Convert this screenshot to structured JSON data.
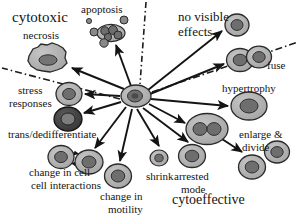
{
  "figure": {
    "background_color": "#ffffff",
    "text_color": "#141414",
    "cell_fill_light": "#b3b3b3",
    "cell_fill_mid": "#9a9a9a",
    "cell_fill_dark": "#4a4a4a",
    "nucleus_fill": "#6e6e6e",
    "outline_color": "#1c1c1c"
  },
  "category_labels": [
    {
      "id": "cytotoxic",
      "text": "cytotoxic",
      "x": 12,
      "y": 10,
      "size": 14.5
    },
    {
      "id": "no-visible",
      "text": "no visible",
      "x": 178,
      "y": 11,
      "size": 12.5
    },
    {
      "id": "no-visible-2",
      "text": "effects",
      "x": 178,
      "y": 26,
      "size": 12.5
    },
    {
      "id": "cytoeffective",
      "text": "cytoeffective",
      "x": 174,
      "y": 195,
      "size": 13.5
    }
  ],
  "outcome_labels": [
    {
      "id": "apoptosis",
      "text": "apoptosis",
      "x": 81,
      "y": 5,
      "size": 10.5
    },
    {
      "id": "necrosis",
      "text": "necrosis",
      "x": 22,
      "y": 31,
      "size": 10.5
    },
    {
      "id": "stress-responses-1",
      "text": "stress",
      "x": 17,
      "y": 86,
      "size": 10.5
    },
    {
      "id": "stress-responses-2",
      "text": "responses",
      "x": 10,
      "y": 99,
      "size": 10.5
    },
    {
      "id": "trans-dedifferentiate",
      "text": "trans/dedifferentiate",
      "x": 8,
      "y": 130,
      "size": 10.5
    },
    {
      "id": "change-cell-cell-1",
      "text": "change in cell-",
      "x": 30,
      "y": 168,
      "size": 10.5
    },
    {
      "id": "change-cell-cell-2",
      "text": "cell interactions",
      "x": 30,
      "y": 181,
      "size": 10.5
    },
    {
      "id": "change-motility-1",
      "text": "change in",
      "x": 100,
      "y": 192,
      "size": 10.5
    },
    {
      "id": "change-motility-2",
      "text": "motility",
      "x": 106,
      "y": 205,
      "size": 10.5
    },
    {
      "id": "shrink",
      "text": "shrink",
      "x": 148,
      "y": 172,
      "size": 10.5
    },
    {
      "id": "arrested-mode-1",
      "text": "arrested",
      "x": 176,
      "y": 172,
      "size": 10.5
    },
    {
      "id": "arrested-mode-2",
      "text": "mode",
      "x": 182,
      "y": 185,
      "size": 10.5
    },
    {
      "id": "fuse",
      "text": "fuse",
      "x": 266,
      "y": 61,
      "size": 10.5
    },
    {
      "id": "hypertrophy",
      "text": "hypertrophy",
      "x": 223,
      "y": 84,
      "size": 10.5
    },
    {
      "id": "enlarge-divide-1",
      "text": "enlarge &",
      "x": 239,
      "y": 130,
      "size": 10.5
    },
    {
      "id": "enlarge-divide-2",
      "text": "divide",
      "x": 242,
      "y": 143,
      "size": 10.5
    }
  ],
  "hub": {
    "id": "central-cell",
    "x": 136,
    "y": 96,
    "rx": 15,
    "ry": 11
  },
  "cells": [
    {
      "id": "necrosis-cell",
      "x": 47,
      "y": 58,
      "rx": 19,
      "ry": 13,
      "style": "jagged"
    },
    {
      "id": "apoptosis-cluster",
      "x": 110,
      "y": 32,
      "rx": 14,
      "ry": 9,
      "style": "fragmented"
    },
    {
      "id": "no-visible-effects-cell",
      "x": 237,
      "y": 25,
      "rx": 12,
      "ry": 11,
      "style": "round"
    },
    {
      "id": "fuse-cell-left",
      "x": 240,
      "y": 59,
      "rx": 13,
      "ry": 11,
      "style": "round"
    },
    {
      "id": "fuse-cell-right",
      "x": 259,
      "y": 57,
      "rx": 12,
      "ry": 10,
      "style": "round"
    },
    {
      "id": "hypertrophy-cell",
      "x": 248,
      "y": 106,
      "rx": 17,
      "ry": 14,
      "style": "round"
    },
    {
      "id": "enlarge-divide-cell",
      "x": 207,
      "y": 129,
      "rx": 20,
      "ry": 15,
      "style": "binucleate"
    },
    {
      "id": "daughter-cell-upper",
      "x": 277,
      "y": 152,
      "rx": 12,
      "ry": 11,
      "style": "round"
    },
    {
      "id": "daughter-cell-lower",
      "x": 252,
      "y": 167,
      "rx": 13,
      "ry": 12,
      "style": "round"
    },
    {
      "id": "arrested-mode-cell",
      "x": 192,
      "y": 156,
      "rx": 13,
      "ry": 11,
      "style": "round"
    },
    {
      "id": "shrink-cell",
      "x": 159,
      "y": 158,
      "rx": 9,
      "ry": 8,
      "style": "round"
    },
    {
      "id": "motility-cell",
      "x": 118,
      "y": 176,
      "rx": 13,
      "ry": 12,
      "style": "round"
    },
    {
      "id": "interaction-cell-left",
      "x": 61,
      "y": 157,
      "rx": 13,
      "ry": 11,
      "style": "round"
    },
    {
      "id": "interaction-cell-right",
      "x": 88,
      "y": 162,
      "rx": 14,
      "ry": 12,
      "style": "round"
    },
    {
      "id": "trans-dediff-cell",
      "x": 68,
      "y": 119,
      "rx": 14,
      "ry": 12,
      "style": "dark"
    },
    {
      "id": "stress-response-cell",
      "x": 69,
      "y": 94,
      "rx": 13,
      "ry": 11,
      "style": "round"
    }
  ],
  "arrows": [
    {
      "id": "arrow-to-necrosis",
      "x1": 124,
      "y1": 89,
      "x2": 72,
      "y2": 68
    },
    {
      "id": "arrow-to-apoptosis",
      "x1": 131,
      "y1": 86,
      "x2": 115,
      "y2": 44
    },
    {
      "id": "arrow-to-no-visible",
      "x1": 148,
      "y1": 90,
      "x2": 222,
      "y2": 30
    },
    {
      "id": "arrow-to-fuse",
      "x1": 150,
      "y1": 94,
      "x2": 224,
      "y2": 64
    },
    {
      "id": "arrow-to-hypertrophy",
      "x1": 151,
      "y1": 99,
      "x2": 228,
      "y2": 106
    },
    {
      "id": "arrow-to-enlarge-divide",
      "x1": 149,
      "y1": 104,
      "x2": 186,
      "y2": 124
    },
    {
      "id": "arrow-to-arrested-mode",
      "x1": 143,
      "y1": 108,
      "x2": 188,
      "y2": 141
    },
    {
      "id": "arrow-to-shrink",
      "x1": 137,
      "y1": 109,
      "x2": 159,
      "y2": 145
    },
    {
      "id": "arrow-to-motility",
      "x1": 132,
      "y1": 109,
      "x2": 120,
      "y2": 161
    },
    {
      "id": "arrow-to-interactions",
      "x1": 126,
      "y1": 107,
      "x2": 95,
      "y2": 148
    },
    {
      "id": "arrow-to-trans-dediff",
      "x1": 121,
      "y1": 102,
      "x2": 84,
      "y2": 113
    },
    {
      "id": "arrow-to-stress",
      "x1": 120,
      "y1": 96,
      "x2": 85,
      "y2": 94
    },
    {
      "id": "arrow-divide-to-daughters",
      "x1": 222,
      "y1": 139,
      "x2": 243,
      "y2": 153
    }
  ],
  "divider_lines": [
    {
      "id": "divider-vertical-top",
      "x1": 146,
      "y1": 2,
      "x2": 140,
      "y2": 84
    },
    {
      "id": "divider-upper-right",
      "x1": 152,
      "y1": 92,
      "x2": 298,
      "y2": 42
    },
    {
      "id": "divider-lower-left",
      "x1": 120,
      "y1": 99,
      "x2": 2,
      "y2": 68
    }
  ],
  "interaction_markers": [
    {
      "id": "interaction-arrow-upper",
      "x1": 70,
      "y1": 153,
      "x2": 79,
      "y2": 155
    },
    {
      "id": "interaction-arrow-lower",
      "x1": 80,
      "y1": 164,
      "x2": 70,
      "y2": 162
    }
  ]
}
